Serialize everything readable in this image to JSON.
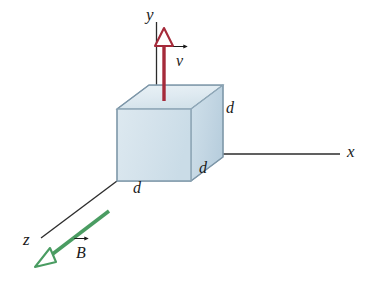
{
  "figure": {
    "type": "physics-vector-diagram",
    "background_color": "#ffffff"
  },
  "axes": {
    "x": {
      "label": "x",
      "direction": "right-horizontal"
    },
    "y": {
      "label": "y",
      "direction": "up-vertical"
    },
    "z": {
      "label": "z",
      "direction": "down-left-diagonal"
    },
    "line_color": "#2b2b2b"
  },
  "cube": {
    "edge_labels": [
      "d",
      "d",
      "d"
    ],
    "label_depth": "d",
    "label_width": "d",
    "label_height": "d",
    "face_top_color": "#dfeaf0",
    "face_front_color": "#d5e3ec",
    "face_right_color": "#c5d8e4",
    "edge_color": "#7e97a8"
  },
  "vectors": {
    "velocity": {
      "label": "v",
      "color": "#a52a3a",
      "direction": "up",
      "arrowhead": "hollow-triangle"
    },
    "magnetic_field": {
      "label": "B",
      "color": "#4a9c62",
      "direction": "down-left",
      "arrowhead": "hollow-triangle"
    }
  }
}
